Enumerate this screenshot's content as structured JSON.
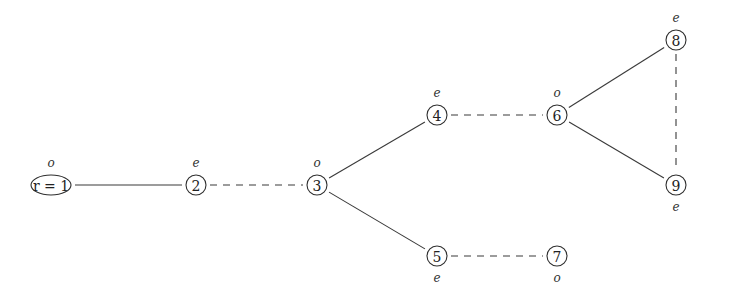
{
  "diagram": {
    "type": "graph",
    "nodes": [
      {
        "id": "1",
        "label": "r = 1",
        "parity": "o",
        "x": 51,
        "y": 185,
        "shape": "ellipse",
        "parity_pos": "above"
      },
      {
        "id": "2",
        "label": "2",
        "parity": "e",
        "x": 196,
        "y": 185,
        "shape": "circle",
        "parity_pos": "above"
      },
      {
        "id": "3",
        "label": "3",
        "parity": "o",
        "x": 317,
        "y": 185,
        "shape": "circle",
        "parity_pos": "above"
      },
      {
        "id": "4",
        "label": "4",
        "parity": "e",
        "x": 437,
        "y": 115,
        "shape": "circle",
        "parity_pos": "above"
      },
      {
        "id": "5",
        "label": "5",
        "parity": "e",
        "x": 437,
        "y": 256,
        "shape": "circle",
        "parity_pos": "below"
      },
      {
        "id": "6",
        "label": "6",
        "parity": "o",
        "x": 557,
        "y": 115,
        "shape": "circle",
        "parity_pos": "above"
      },
      {
        "id": "7",
        "label": "7",
        "parity": "o",
        "x": 557,
        "y": 256,
        "shape": "circle",
        "parity_pos": "below"
      },
      {
        "id": "8",
        "label": "8",
        "parity": "e",
        "x": 676,
        "y": 40,
        "shape": "circle",
        "parity_pos": "above"
      },
      {
        "id": "9",
        "label": "9",
        "parity": "e",
        "x": 676,
        "y": 185,
        "shape": "circle",
        "parity_pos": "below"
      }
    ],
    "edges": [
      {
        "from": "1",
        "to": "2",
        "style": "solid"
      },
      {
        "from": "2",
        "to": "3",
        "style": "dashed"
      },
      {
        "from": "3",
        "to": "4",
        "style": "solid"
      },
      {
        "from": "3",
        "to": "5",
        "style": "solid"
      },
      {
        "from": "4",
        "to": "6",
        "style": "dashed"
      },
      {
        "from": "5",
        "to": "7",
        "style": "dashed"
      },
      {
        "from": "6",
        "to": "8",
        "style": "solid"
      },
      {
        "from": "6",
        "to": "9",
        "style": "solid"
      },
      {
        "from": "8",
        "to": "9",
        "style": "dashed"
      }
    ]
  }
}
